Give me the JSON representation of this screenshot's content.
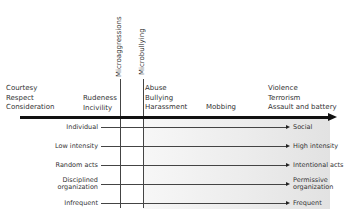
{
  "diagram": {
    "vertical_markers": [
      {
        "label": "Microaggressions",
        "x": 120
      },
      {
        "label": "Microbullying",
        "x": 143
      }
    ],
    "top_categories": [
      {
        "lines": [
          "Courtesy",
          "Respect",
          "Consideration"
        ]
      },
      {
        "lines": [
          "Rudeness",
          "Incivility"
        ]
      },
      {
        "lines": [
          "Abuse",
          "Bullying",
          "Harassment"
        ]
      },
      {
        "lines": [
          "Mobbing"
        ]
      },
      {
        "lines": [
          "Violence",
          "Terrorism",
          "Assault and battery"
        ]
      }
    ],
    "rows": [
      {
        "left": [
          "Individual"
        ],
        "right": [
          "Social"
        ]
      },
      {
        "left": [
          "Low  intensity"
        ],
        "right": [
          "High intensity"
        ]
      },
      {
        "left": [
          "Random acts"
        ],
        "right": [
          "Intentional acts"
        ]
      },
      {
        "left": [
          "Disciplined",
          "organization"
        ],
        "right": [
          "Permissive",
          "organization"
        ]
      },
      {
        "left": [
          "Infrequent"
        ],
        "right": [
          "Frequent"
        ]
      }
    ]
  }
}
